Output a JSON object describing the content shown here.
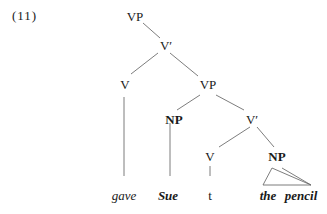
{
  "example_number": "(11)",
  "tree": {
    "root": "VP",
    "vbar1": "V′",
    "v1": "V",
    "vp2": "VP",
    "np1": "NP",
    "vbar2": "V′",
    "v2": "V",
    "np2": "NP"
  },
  "leaves": {
    "gave": "gave",
    "sue": "Sue",
    "trace": "t",
    "the": "the",
    "pencil": "pencil"
  },
  "line_color": "#6e6e6e"
}
